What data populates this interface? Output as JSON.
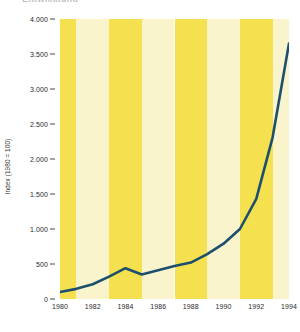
{
  "title_fragment": "Entwicklung",
  "colors": {
    "line": "#1c4f6e",
    "band_dark": "#f5e04f",
    "band_light": "#faf4cc",
    "text": "#2b2b2b",
    "tick": "#4a4a4a",
    "background": "#ffffff"
  },
  "chart_data": {
    "type": "line",
    "title": "",
    "xlabel": "",
    "ylabel": "Index (1980 = 100)",
    "xlim": [
      1980,
      1994
    ],
    "ylim": [
      0,
      4000
    ],
    "grid": false,
    "legend": "none",
    "y_ticks": [
      0,
      500,
      1000,
      1500,
      2000,
      2500,
      3000,
      3500,
      4000
    ],
    "y_tick_labels": [
      "0",
      "500",
      "1.000",
      "1.500",
      "2.000",
      "2.500",
      "3.000",
      "3.500",
      "4.000"
    ],
    "x_ticks": [
      1980,
      1982,
      1984,
      1986,
      1988,
      1990,
      1992,
      1994
    ],
    "x_tick_labels": [
      "1980",
      "1982",
      "1984",
      "1986",
      "1988",
      "1990",
      "1992",
      "1994"
    ],
    "background_bands": "alternating vertical yellow and cream stripes, 2-year width",
    "series": [
      {
        "name": "Index (1980 = 100)",
        "x": [
          1980,
          1981,
          1982,
          1983,
          1984,
          1985,
          1986,
          1987,
          1988,
          1989,
          1990,
          1991,
          1992,
          1993,
          1994
        ],
        "values": [
          100,
          145,
          210,
          320,
          440,
          350,
          410,
          470,
          520,
          640,
          790,
          1000,
          1430,
          2310,
          3650
        ]
      }
    ]
  }
}
